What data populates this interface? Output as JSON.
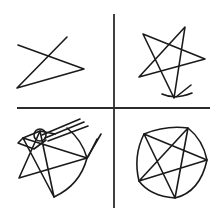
{
  "figure": {
    "width": 223,
    "height": 221,
    "background": "#ffffff",
    "ink_color": "#1a1a1a",
    "dividers": {
      "vertical": {
        "x": 114,
        "y1": 14,
        "y2": 208
      },
      "horizontal": {
        "y": 108,
        "x1": 17,
        "x2": 210
      }
    },
    "panels": [
      {
        "id": "top-left",
        "description": "incomplete star attempt (three strokes)",
        "paths": [
          "M18 45 L84 69 L17 88 L67 37"
        ]
      },
      {
        "id": "top-right",
        "description": "five-pointed star with extra strokes at bottom point",
        "paths": [
          "M174 98 L143 34 L205 59 L139 77 L185 27 L174 98",
          "M162 94 Q175 100 192 93",
          "M176 97 L191 85"
        ]
      },
      {
        "id": "bottom-left",
        "description": "star with enclosing shape, small circle and overshooting strokes",
        "paths": [
          "M54 197 L23 138 L87 158 L19 178 L40 131 L54 197",
          "M23 138 L40 131 L55 134",
          "M23 138 L18 143 L34 149 L46 140",
          "M54 197 Q80 185 87 158 Q82 140 67 128",
          "M45 138 L84 122",
          "M48 141 L88 126",
          "M42 135 L80 119",
          "M87 158 L101 134",
          "M88 157 L97 139"
        ],
        "circles": [
          {
            "cx": 40,
            "cy": 135,
            "r": 6
          }
        ]
      },
      {
        "id": "bottom-right",
        "description": "pentagram inscribed in a circle",
        "paths": [
          "M175 198 L144 134 L207 160 L139 181 L188 128 L175 198",
          "M144 134 Q166 125 188 128 Q203 140 207 160 Q200 192 175 198 Q150 196 139 181 Q133 156 144 134"
        ]
      }
    ]
  }
}
